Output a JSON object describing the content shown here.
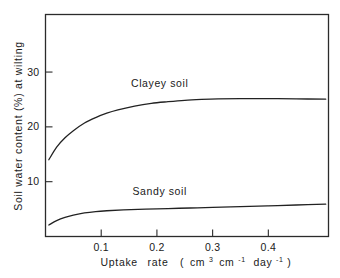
{
  "chart_data": {
    "type": "line",
    "title": "",
    "xlabel": "Uptake rate ( cm3 cm-1 day-1)",
    "xlabel_parts": {
      "name": "Uptake",
      "name2": "rate",
      "open_paren": "(",
      "unit1_base": "cm",
      "unit1_sup": "3",
      "unit2_base": "cm",
      "unit2_sup": "-1",
      "unit3_base": "day",
      "unit3_sup": "-1",
      "close_paren": ")"
    },
    "ylabel": "Soil water content (%) at wilting",
    "xlim": [
      0,
      0.508
    ],
    "ylim": [
      0,
      40.5
    ],
    "xticks": [
      0.1,
      0.2,
      0.3,
      0.4
    ],
    "xtick_labels": [
      "0.1",
      "0.2",
      "0.3",
      "0.4"
    ],
    "yticks": [
      10,
      20,
      30
    ],
    "ytick_labels": [
      "10",
      "20",
      "30"
    ],
    "grid": false,
    "legend_position": "inline-annotations",
    "series": [
      {
        "name": "Clayey soil",
        "label_x": 0.205,
        "label_y": 27.3,
        "x": [
          0.006,
          0.02,
          0.035,
          0.05,
          0.07,
          0.09,
          0.11,
          0.13,
          0.16,
          0.19,
          0.22,
          0.25,
          0.28,
          0.31,
          0.35,
          0.4,
          0.45,
          0.503
        ],
        "y": [
          14.0,
          16.3,
          18.0,
          19.3,
          20.7,
          21.7,
          22.5,
          23.1,
          23.8,
          24.3,
          24.6,
          24.85,
          25.0,
          25.1,
          25.15,
          25.15,
          25.1,
          25.05
        ]
      },
      {
        "name": "Sandy soil",
        "label_x": 0.205,
        "label_y": 7.6,
        "x": [
          0.006,
          0.02,
          0.035,
          0.05,
          0.07,
          0.09,
          0.11,
          0.14,
          0.18,
          0.22,
          0.26,
          0.3,
          0.35,
          0.4,
          0.45,
          0.503
        ],
        "y": [
          2.1,
          2.9,
          3.5,
          3.9,
          4.3,
          4.55,
          4.7,
          4.85,
          5.0,
          5.1,
          5.2,
          5.3,
          5.45,
          5.6,
          5.75,
          5.9
        ]
      }
    ]
  },
  "axis": {
    "ylabel_text": "Soil  water  content  (%)  at  wilting"
  }
}
